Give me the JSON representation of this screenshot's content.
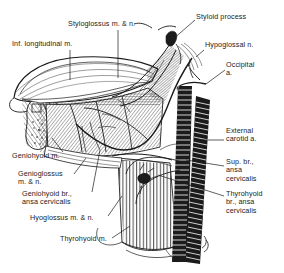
{
  "figure": {
    "style": "pen-and-ink line drawing, black on white",
    "width": 284,
    "height": 273,
    "ink_color": "#1b1b1b",
    "paper_color": "#ffffff"
  },
  "labels": [
    {
      "id": "styloglossus",
      "text": "Styloglossus m. & n.",
      "lines": [
        "Styloglossus m. & n."
      ],
      "x": 68,
      "y": 20,
      "align": "left",
      "leader": [
        [
          118,
          30
        ],
        [
          118,
          78
        ]
      ]
    },
    {
      "id": "styloid-process",
      "text": "Styloid process",
      "lines": [
        "Styloid process"
      ],
      "x": 196,
      "y": 13,
      "align": "left",
      "leader": [
        [
          195,
          20
        ],
        [
          172,
          40
        ]
      ]
    },
    {
      "id": "inf-longitudinal",
      "text": "Inf. longitudinal m.",
      "lines": [
        "Inf. longitudinal m."
      ],
      "x": 12,
      "y": 40,
      "align": "left",
      "leader": [
        [
          70,
          50
        ],
        [
          70,
          80
        ]
      ]
    },
    {
      "id": "hypoglossal-n",
      "text": "Hypoglossal n.",
      "lines": [
        "Hypoglossal n."
      ],
      "x": 205,
      "y": 41,
      "align": "left",
      "leader": [
        [
          204,
          50
        ],
        [
          196,
          57
        ]
      ]
    },
    {
      "id": "occipital-a",
      "text": "Occipital a.",
      "lines": [
        "Occipital",
        "a."
      ],
      "x": 226,
      "y": 61,
      "align": "left",
      "leader": [
        [
          225,
          70
        ],
        [
          206,
          84
        ]
      ]
    },
    {
      "id": "external-carotid-a",
      "text": "External carotid a.",
      "lines": [
        "External",
        "carotid a."
      ],
      "x": 226,
      "y": 127,
      "align": "left",
      "leader": [
        [
          224,
          140
        ],
        [
          196,
          140
        ]
      ]
    },
    {
      "id": "sup-br-ansa-cervicalis",
      "text": "Sup. br., ansa cervicalis",
      "lines": [
        "Sup. br.,",
        "ansa",
        "cervicalis"
      ],
      "x": 226,
      "y": 158,
      "align": "left",
      "leader": [
        [
          224,
          166
        ],
        [
          186,
          160
        ]
      ]
    },
    {
      "id": "thyrohyoid-br-ansa-cervicalis",
      "text": "Thyrohyoid br., ansa cervicalis",
      "lines": [
        "Thyrohyoid",
        "br., ansa",
        "cervicalis"
      ],
      "x": 226,
      "y": 190,
      "align": "left",
      "leader": [
        [
          224,
          196
        ],
        [
          158,
          175
        ]
      ]
    },
    {
      "id": "geniohyoid-m",
      "text": "Geniohyoid m.",
      "lines": [
        "Geniohyoid m."
      ],
      "x": 12,
      "y": 152,
      "align": "left",
      "leader": [
        [
          63,
          152
        ],
        [
          52,
          138
        ]
      ]
    },
    {
      "id": "genioglossus",
      "text": "Genioglossus m. & n.",
      "lines": [
        "Genioglossus",
        "m. & n."
      ],
      "x": 18,
      "y": 170,
      "align": "left",
      "leader": [
        [
          74,
          174
        ],
        [
          86,
          158
        ]
      ]
    },
    {
      "id": "geniohyoid-br-ansa-cervicalis",
      "text": "Geniohyoid br., ansa cervicalis",
      "lines": [
        "Geniohyoid br.,",
        "ansa cervicalis"
      ],
      "x": 22,
      "y": 190,
      "align": "left",
      "leader": [
        [
          92,
          192
        ],
        [
          100,
          150
        ]
      ]
    },
    {
      "id": "hyoglossus",
      "text": "Hyoglossus m. & n.",
      "lines": [
        "Hyoglossus m. & n."
      ],
      "x": 30,
      "y": 214,
      "align": "left",
      "leader": [
        [
          108,
          216
        ],
        [
          122,
          196
        ]
      ]
    },
    {
      "id": "thyrohyoid-m",
      "text": "Thyrohyoid m.",
      "lines": [
        "Thyrohyoid m."
      ],
      "x": 60,
      "y": 235,
      "align": "left",
      "leader": [
        [
          112,
          238
        ],
        [
          130,
          226
        ]
      ]
    }
  ],
  "structures": [
    {
      "id": "tongue-body",
      "name": "tongue dorsum",
      "rendering": "outlined dome with fine contour hatching"
    },
    {
      "id": "inferior-longitudinal-muscle",
      "name": "inferior longitudinal muscle",
      "rendering": "diagonal hatch band"
    },
    {
      "id": "styloglossus-muscle",
      "name": "styloglossus muscle",
      "rendering": "fan of fine fibers descending from styloid"
    },
    {
      "id": "hyoglossus-muscle",
      "name": "hyoglossus muscle",
      "rendering": "dense diagonal hatch sheet"
    },
    {
      "id": "genioglossus-muscle",
      "name": "genioglossus muscle",
      "rendering": "radiating hatch wedge at left"
    },
    {
      "id": "geniohyoid-muscle",
      "name": "geniohyoid muscle",
      "rendering": "lower-left hatched strap"
    },
    {
      "id": "mandible-section",
      "name": "mandible cut section",
      "rendering": "teardrop outline with stipple marrow"
    },
    {
      "id": "thyrohyoid-muscle",
      "name": "thyrohyoid muscle",
      "rendering": "vertical parallel fiber sheet"
    },
    {
      "id": "external-carotid-artery",
      "name": "external carotid artery",
      "rendering": "solid black banded tube"
    },
    {
      "id": "internal-jugular-vein",
      "name": "second banded vessel trunk",
      "rendering": "solid black banded tube"
    },
    {
      "id": "hypoglossal-nerve",
      "name": "hypoglossal nerve",
      "rendering": "thin curving outlined cord"
    },
    {
      "id": "ansa-cervicalis",
      "name": "ansa cervicalis branches",
      "rendering": "fine nerve filaments crossing muscle"
    },
    {
      "id": "styloid-process",
      "name": "styloid process",
      "rendering": "small dark spur at upper right"
    }
  ]
}
